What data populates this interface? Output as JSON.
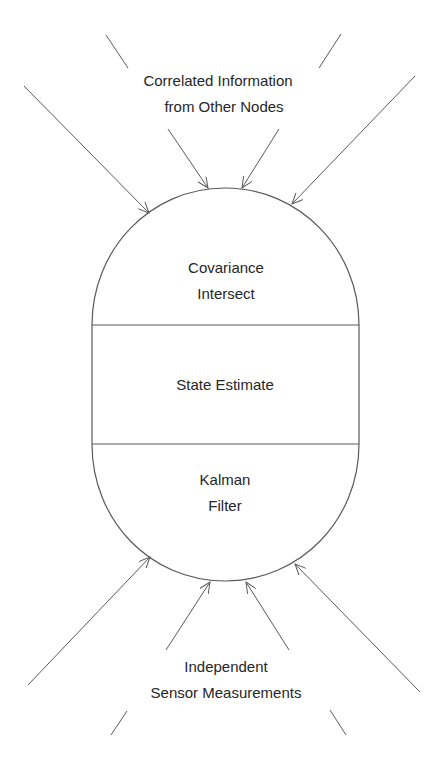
{
  "diagram": {
    "type": "data-fusion-node",
    "colors": {
      "stroke": "#5a5a5a",
      "text": "#262626",
      "background": "#ffffff"
    },
    "top_label": {
      "line1": "Correlated Information",
      "line2": "from Other Nodes"
    },
    "bottom_label": {
      "line1": "Independent",
      "line2": "Sensor Measurements"
    },
    "sections": [
      {
        "id": "covariance-intersect",
        "line1": "Covariance",
        "line2": "Intersect"
      },
      {
        "id": "state-estimate",
        "line1": "State Estimate"
      },
      {
        "id": "kalman-filter",
        "line1": "Kalman",
        "line2": "Filter"
      }
    ],
    "incoming_arrows_top": 4,
    "incoming_arrows_bottom": 4
  }
}
